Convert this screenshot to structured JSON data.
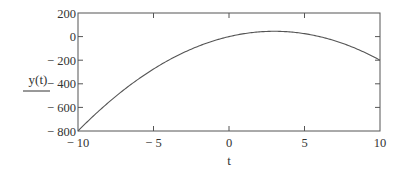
{
  "chart_data": {
    "type": "line",
    "title": "",
    "xlabel": "t",
    "ylabel": "y(t)",
    "xlim": [
      -10,
      10
    ],
    "ylim": [
      -800,
      200
    ],
    "x_ticks": [
      -10,
      -5,
      0,
      5,
      10
    ],
    "y_ticks": [
      200,
      0,
      -200,
      -400,
      -600,
      -800
    ],
    "x_tick_labels": [
      "− 10",
      "− 5",
      "0",
      "5",
      "10"
    ],
    "y_tick_labels": [
      "200",
      "0",
      "− 200",
      "− 400",
      "− 600",
      "− 800"
    ],
    "grid": false,
    "legend": null,
    "series": [
      {
        "name": "y(t)",
        "function": "y = -5t^2 + 30t",
        "x": [
          -10,
          -8,
          -6,
          -4,
          -2,
          0,
          2,
          3,
          4,
          6,
          8,
          10
        ],
        "y": [
          -800,
          -560,
          -360,
          -200,
          -80,
          0,
          40,
          45,
          40,
          0,
          -80,
          -200
        ],
        "color": "#555555"
      }
    ]
  },
  "colors": {
    "frame": "#555555",
    "curve": "#555555",
    "text": "#333333",
    "background": "#ffffff"
  }
}
